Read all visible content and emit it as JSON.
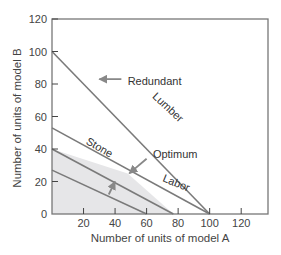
{
  "chart_data": {
    "type": "line",
    "title": "",
    "xlabel": "Number of units of model A",
    "ylabel": "Number of units of model B",
    "xlim": [
      0,
      137
    ],
    "ylim": [
      0,
      120
    ],
    "xticks": [
      20,
      40,
      60,
      80,
      100,
      120
    ],
    "yticks": [
      0,
      20,
      40,
      60,
      80,
      100,
      120
    ],
    "grid": false,
    "legend": "none",
    "series": [
      {
        "name": "Lumber",
        "points": [
          [
            0,
            100
          ],
          [
            100,
            0
          ]
        ],
        "label_pos": [
          72,
          64
        ],
        "label_angle": 43
      },
      {
        "name": "Labor",
        "points": [
          [
            0,
            53
          ],
          [
            100,
            0
          ]
        ],
        "label_pos": [
          78,
          17
        ],
        "label_angle": 22
      },
      {
        "name": "Stone",
        "points": [
          [
            0,
            40
          ],
          [
            77,
            0
          ]
        ],
        "label_pos": [
          29,
          39
        ],
        "label_angle": 30
      },
      {
        "name": "Iso-profit",
        "points": [
          [
            0,
            27
          ],
          [
            60,
            0
          ]
        ]
      }
    ],
    "feasible_region": [
      [
        0,
        0
      ],
      [
        0,
        40
      ],
      [
        48,
        25
      ],
      [
        77,
        0
      ]
    ],
    "annotations": [
      {
        "text": "Redundant",
        "text_pos": [
          48,
          82
        ],
        "arrow_from": [
          44,
          83
        ],
        "arrow_to": [
          30,
          83
        ]
      },
      {
        "text": "Optimum",
        "text_pos": [
          64,
          37
        ],
        "arrow_from": [
          60,
          34
        ],
        "arrow_to": [
          49,
          25
        ]
      },
      {
        "text": "",
        "arrow_from": [
          36,
          12
        ],
        "arrow_to": [
          40,
          20
        ]
      }
    ]
  },
  "labels": {
    "x_axis_title": "Number of units of model A",
    "y_axis_title": "Number of units of model B",
    "redundant": "Redundant",
    "optimum": "Optimum",
    "lumber": "Lumber",
    "labor": "Labor",
    "stone": "Stone"
  },
  "colors": {
    "line": "#7a7a7a",
    "region": "#e6e6e8",
    "frame": "#777777"
  }
}
